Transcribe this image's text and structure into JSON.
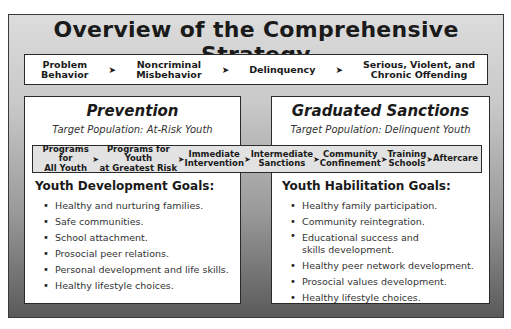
{
  "title": "Overview of the Comprehensive Strategy",
  "continuum": {
    "items": [
      "Problem\nBehavior",
      "Noncriminal\nMisbehavior",
      "Delinquency",
      "Serious, Violent, and\nChronic Offending"
    ],
    "arrow_icon": "➤"
  },
  "prevention": {
    "title": "Prevention",
    "target": "Target Population: At-Risk Youth",
    "goals_title": "Youth Development Goals:",
    "goals": [
      "Healthy and nurturing families.",
      "Safe communities.",
      "School attachment.",
      "Prosocial peer relations.",
      "Personal development and life skills.",
      "Healthy lifestyle choices."
    ]
  },
  "sanctions": {
    "title": "Graduated Sanctions",
    "target": "Target Population: Delinquent Youth",
    "goals_title": "Youth Habilitation Goals:",
    "goals": [
      "Healthy family participation.",
      "Community reintegration.",
      "Educational success and\nskills development.",
      "Healthy peer network development.",
      "Prosocial values development.",
      "Healthy lifestyle choices."
    ]
  },
  "programs": {
    "items": [
      "Programs for\nAll Youth",
      "Programs for Youth\nat Greatest Risk",
      "Immediate\nIntervention",
      "Intermediate\nSanctions",
      "Community\nConfinement",
      "Training\nSchools",
      "Aftercare"
    ],
    "arrow_icon": "➤"
  },
  "colors": {
    "border": "#2a2a2a",
    "band_fill": "#e2e2e2",
    "frame_top": "#dcdcdc",
    "frame_bottom": "#5a5a5a"
  }
}
